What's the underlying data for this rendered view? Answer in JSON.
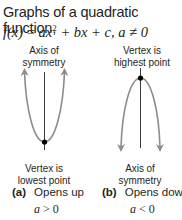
{
  "title": "Graphs of a quadratic function,",
  "formula": {
    "fx": "f(x)",
    "eq": " = ",
    "ax2": "ax",
    "sup": "2",
    "rest": " + bx + c, a ≠ 0"
  },
  "graph_a": {
    "top_label_line1": "Axis of",
    "top_label_line2": "symmetry",
    "bottom_label_line1": "Vertex is",
    "bottom_label_line2": "lowest point",
    "caption_letter": "(a)",
    "caption_text": "Opens up",
    "condition_var": "a",
    "condition_rest": " > 0"
  },
  "graph_b": {
    "top_label_line1": "Vertex is",
    "top_label_line2": "highest point",
    "bottom_label_line1": "Axis of",
    "bottom_label_line2": "symmetry",
    "caption_letter": "(b)",
    "caption_text": "Opens down",
    "condition_var": "a",
    "condition_rest": " < 0"
  },
  "colors": {
    "curve": "#8c8c8c",
    "axis": "#3a3a3a",
    "vertex": "#000000",
    "text": "#231f20"
  }
}
